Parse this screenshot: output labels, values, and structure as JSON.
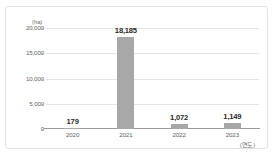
{
  "chart_data": {
    "type": "bar",
    "title": "",
    "subtitle": "",
    "xlabel": "(연도)",
    "ylabel": "(ha)",
    "unit_label": "(ha)",
    "categories": [
      "2020",
      "2021",
      "2022",
      "2023"
    ],
    "values": [
      179,
      18185,
      1072,
      1149
    ],
    "value_labels": [
      "179",
      "18,185",
      "1,072",
      "1,149"
    ],
    "ylim": [
      0,
      20000
    ],
    "ytick_values": [
      0,
      5000,
      10000,
      15000,
      20000
    ],
    "ytick_labels": [
      "0",
      "5,000",
      "10,000",
      "15,000",
      "20,000"
    ],
    "grid": true,
    "legend": false,
    "legend_position": "none",
    "series": [
      {
        "name": "area",
        "values": [
          179,
          18185,
          1072,
          1149
        ]
      }
    ],
    "colors": {
      "bar": "#a8a8a8",
      "gridline": "#e4e4e4",
      "axis": "#9a9a9a",
      "tick_text": "#666666",
      "value_text": "#2b2b2b",
      "frame": "#e2e2e2",
      "background": "#ffffff"
    }
  }
}
